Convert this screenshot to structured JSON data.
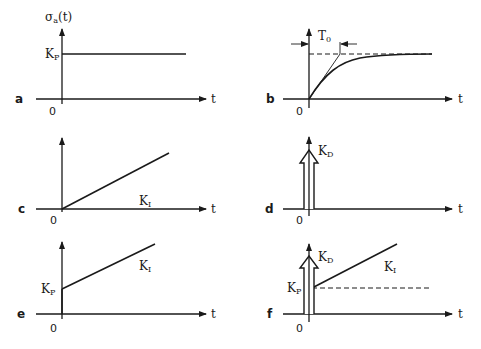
{
  "figure": {
    "y_axis_label": "σ",
    "y_axis_label_sub": "a",
    "y_axis_label_arg": "(t)",
    "x_axis_label": "t",
    "origin_label": "0",
    "ink_color": "#1a1a1a",
    "background": "#ffffff"
  },
  "panels": [
    {
      "id": "a",
      "label": "a",
      "description": "Proportional step response",
      "annotations": [
        {
          "text": "K",
          "sub": "P"
        }
      ]
    },
    {
      "id": "b",
      "label": "b",
      "description": "First-order lag step response with time constant",
      "annotations": [
        {
          "text": "T",
          "sub": "0"
        }
      ]
    },
    {
      "id": "c",
      "label": "c",
      "description": "Integral ramp response",
      "annotations": [
        {
          "text": "K",
          "sub": "I"
        }
      ]
    },
    {
      "id": "d",
      "label": "d",
      "description": "Derivative impulse response",
      "annotations": [
        {
          "text": "K",
          "sub": "D"
        }
      ]
    },
    {
      "id": "e",
      "label": "e",
      "description": "PI step response",
      "annotations": [
        {
          "text": "K",
          "sub": "P"
        },
        {
          "text": "K",
          "sub": "I"
        }
      ]
    },
    {
      "id": "f",
      "label": "f",
      "description": "PID step response",
      "annotations": [
        {
          "text": "K",
          "sub": "D"
        },
        {
          "text": "K",
          "sub": "P"
        },
        {
          "text": "K",
          "sub": "I"
        }
      ]
    }
  ]
}
